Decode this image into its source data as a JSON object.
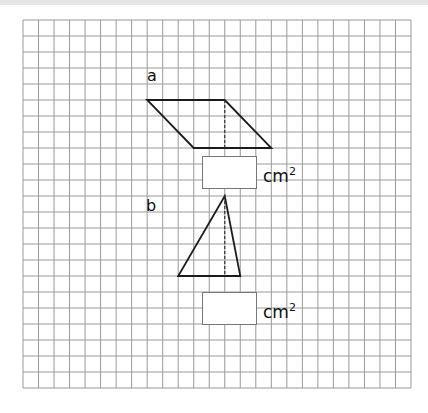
{
  "worksheet": {
    "grid": {
      "left": 23,
      "top": 20,
      "columns": 25,
      "rows": 23,
      "cell_width": 15.52,
      "cell_height": 16,
      "line_color": "#9a9a9a"
    },
    "shape_color": "#1c1c1c",
    "problems": [
      {
        "label": "a",
        "shape": "parallelogram",
        "vertices_grid": [
          [
            8,
            5
          ],
          [
            13,
            5
          ],
          [
            16,
            8
          ],
          [
            11,
            8
          ]
        ],
        "height_line_grid": [
          [
            13,
            5
          ],
          [
            13,
            8
          ]
        ],
        "answer_value": "",
        "unit": "cm",
        "unit_exponent": "2"
      },
      {
        "label": "b",
        "shape": "triangle",
        "vertices_grid": [
          [
            13,
            11
          ],
          [
            14,
            16
          ],
          [
            10,
            16
          ]
        ],
        "height_line_grid": [
          [
            13,
            11
          ],
          [
            13,
            16
          ]
        ],
        "answer_value": "",
        "unit": "cm",
        "unit_exponent": "2"
      }
    ]
  }
}
